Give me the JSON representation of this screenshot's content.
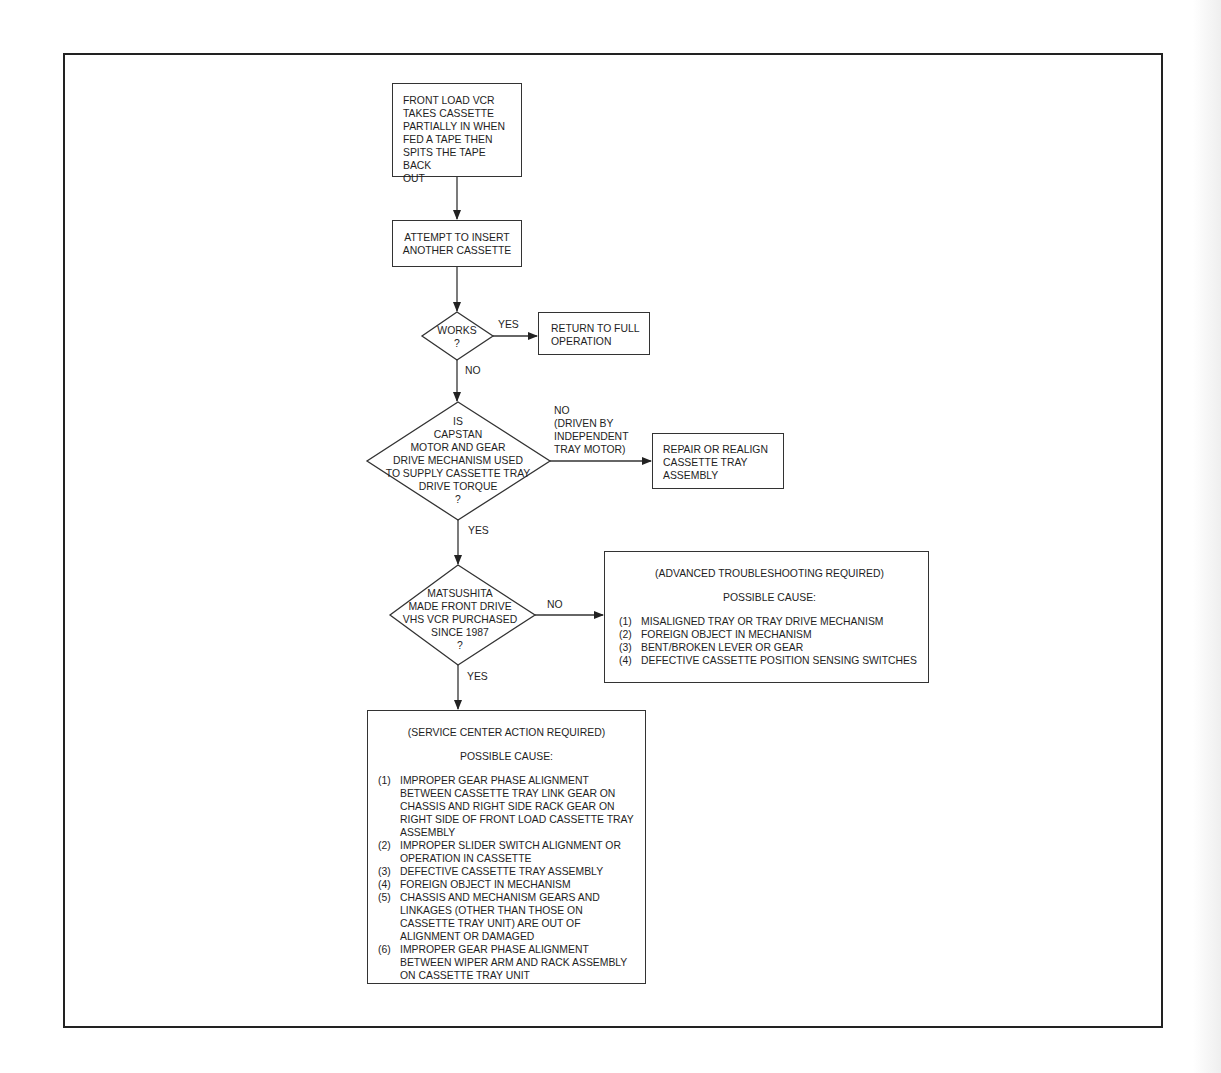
{
  "flowchart": {
    "start": {
      "text": "FRONT LOAD VCR\nTAKES CASSETTE\nPARTIALLY IN WHEN\nFED A TAPE THEN\nSPITS THE TAPE BACK\nOUT"
    },
    "attempt": {
      "text": "ATTEMPT TO INSERT\nANOTHER CASSETTE"
    },
    "decision_works": {
      "text": "WORKS\n?",
      "yes_label": "YES",
      "no_label": "NO"
    },
    "return_box": {
      "text": "RETURN TO FULL\nOPERATION"
    },
    "decision_capstan": {
      "text": "IS\nCAPSTAN\nMOTOR AND GEAR\nDRIVE MECHANISM USED\nTO SUPPLY CASSETTE TRAY\nDRIVE TORQUE\n?",
      "no_label": "NO\n(DRIVEN BY\nINDEPENDENT\nTRAY MOTOR)",
      "yes_label": "YES"
    },
    "repair_box": {
      "text": "REPAIR OR REALIGN\nCASSETTE TRAY\nASSEMBLY"
    },
    "decision_matsushita": {
      "text": "MATSUSHITA\nMADE FRONT DRIVE\nVHS VCR PURCHASED\nSINCE 1987\n?",
      "no_label": "NO",
      "yes_label": "YES"
    },
    "advanced_box": {
      "heading": "(ADVANCED TROUBLESHOOTING REQUIRED)",
      "subheading": "POSSIBLE CAUSE:",
      "causes": [
        {
          "num": "(1)",
          "text": "MISALIGNED TRAY OR TRAY DRIVE MECHANISM"
        },
        {
          "num": "(2)",
          "text": "FOREIGN OBJECT IN MECHANISM"
        },
        {
          "num": "(3)",
          "text": "BENT/BROKEN LEVER OR GEAR"
        },
        {
          "num": "(4)",
          "text": "DEFECTIVE CASSETTE POSITION SENSING SWITCHES"
        }
      ]
    },
    "service_box": {
      "heading": "(SERVICE CENTER ACTION REQUIRED)",
      "subheading": "POSSIBLE CAUSE:",
      "causes": [
        {
          "num": "(1)",
          "text": "IMPROPER GEAR PHASE ALIGNMENT BETWEEN CASSETTE TRAY LINK GEAR ON CHASSIS AND RIGHT SIDE RACK GEAR ON RIGHT SIDE OF FRONT LOAD CASSETTE TRAY ASSEMBLY"
        },
        {
          "num": "(2)",
          "text": "IMPROPER SLIDER SWITCH ALIGNMENT OR OPERATION IN CASSETTE"
        },
        {
          "num": "(3)",
          "text": "DEFECTIVE CASSETTE TRAY ASSEMBLY"
        },
        {
          "num": "(4)",
          "text": "FOREIGN OBJECT IN MECHANISM"
        },
        {
          "num": "(5)",
          "text": "CHASSIS AND MECHANISM GEARS AND LINKAGES (OTHER THAN THOSE ON CASSETTE TRAY UNIT) ARE OUT OF ALIGNMENT OR DAMAGED"
        },
        {
          "num": "(6)",
          "text": "IMPROPER GEAR PHASE ALIGNMENT BETWEEN WIPER ARM AND RACK ASSEMBLY ON CASSETTE TRAY UNIT"
        }
      ]
    }
  },
  "colors": {
    "line": "#333333",
    "frame": "#222222",
    "background": "#ffffff"
  }
}
